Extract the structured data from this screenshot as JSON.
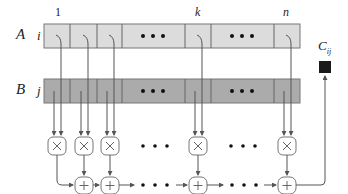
{
  "diagram": {
    "type": "matrix-multiplication-dataflow",
    "row_a": {
      "matrix_label": "A",
      "index_label": "i",
      "fill": "#d9d9d9"
    },
    "row_b": {
      "matrix_label": "B",
      "index_label": "j",
      "fill": "#a9a9a9"
    },
    "column_labels": {
      "first": "1",
      "middle": "k",
      "last": "n"
    },
    "ellipsis": "• • •",
    "multiply_symbol": "×",
    "add_symbol": "+",
    "output": {
      "label": "C",
      "subscript": "ij",
      "fill": "#1a1a1a"
    },
    "multiply_nodes": [
      "×",
      "×",
      "×",
      "×",
      "×"
    ],
    "add_nodes": [
      "+",
      "+",
      "+",
      "+"
    ],
    "colors": {
      "line": "#555555",
      "border": "#666666",
      "text": "#222222"
    }
  }
}
